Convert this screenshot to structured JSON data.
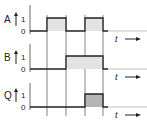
{
  "diagram": {
    "colors": {
      "line": "#222222",
      "fill_light": "#e3e3e3",
      "fill_dark": "#b5b5b5",
      "grid": "#555555"
    },
    "time_label": "t",
    "signals": [
      {
        "name": "A",
        "high_label": "1",
        "low_label": "0",
        "pulses": [
          [
            1,
            2
          ],
          [
            3,
            4
          ]
        ]
      },
      {
        "name": "B",
        "high_label": "1",
        "low_label": "0",
        "pulses": [
          [
            2,
            4
          ]
        ]
      },
      {
        "name": "Q",
        "high_label": "1",
        "low_label": "0",
        "pulses": [
          [
            3,
            4
          ]
        ]
      }
    ]
  }
}
